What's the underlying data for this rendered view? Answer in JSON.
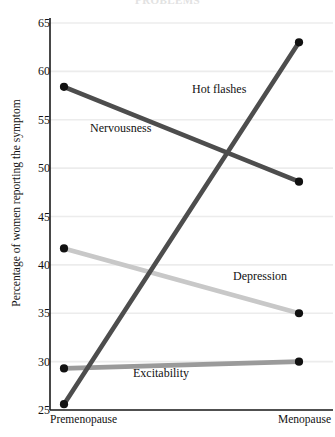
{
  "cropped_title": "PROBLEMS",
  "axes": {
    "ylabel": "Percentage of women reporting the symptom",
    "y_ticks": [
      "65",
      "60",
      "55",
      "50",
      "45",
      "40",
      "35",
      "30",
      "25"
    ],
    "x_ticks": [
      "Premenopause",
      "Menopause"
    ]
  },
  "series_labels": {
    "hot_flashes": "Hot flashes",
    "nervousness": "Nervousness",
    "depression": "Depression",
    "excitability": "Excitability"
  },
  "colors": {
    "hot_flashes": "#4d4d4d",
    "nervousness": "#4d4d4d",
    "depression": "#c8c8c8",
    "excitability": "#9a9a9a",
    "gridline": "#ececec",
    "axis": "#1a1a1a",
    "marker": "#111111"
  },
  "chart_data": {
    "type": "line",
    "title": "",
    "xlabel": "",
    "ylabel": "Percentage of women reporting the symptom",
    "categories": [
      "Premenopause",
      "Menopause"
    ],
    "ylim": [
      25,
      65
    ],
    "yticks": [
      25,
      30,
      35,
      40,
      45,
      50,
      55,
      60,
      65
    ],
    "grid": true,
    "legend": "inline-labels",
    "series": [
      {
        "name": "Hot flashes",
        "values": [
          25.6,
          63.0
        ],
        "color": "#4d4d4d"
      },
      {
        "name": "Nervousness",
        "values": [
          58.4,
          48.6
        ],
        "color": "#4d4d4d"
      },
      {
        "name": "Depression",
        "values": [
          41.7,
          35.0
        ],
        "color": "#c8c8c8"
      },
      {
        "name": "Excitability",
        "values": [
          29.3,
          30.0
        ],
        "color": "#9a9a9a"
      }
    ]
  }
}
